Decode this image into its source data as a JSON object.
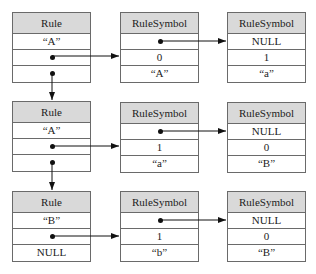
{
  "diagram": {
    "title": "",
    "rows": [
      {
        "rule": {
          "header": "Rule",
          "fields": [
            "“A”",
            "•",
            "•"
          ]
        },
        "symbol1": {
          "header": "RuleSymbol",
          "fields": [
            "•",
            "0",
            "“A”"
          ]
        },
        "symbol2": {
          "header": "RuleSymbol",
          "fields": [
            "NULL",
            "1",
            "“a”"
          ]
        }
      },
      {
        "rule": {
          "header": "Rule",
          "fields": [
            "“A”",
            "•",
            "•"
          ]
        },
        "symbol1": {
          "header": "RuleSymbol",
          "fields": [
            "•",
            "1",
            "“a”"
          ]
        },
        "symbol2": {
          "header": "RuleSymbol",
          "fields": [
            "NULL",
            "0",
            "“B”"
          ]
        }
      },
      {
        "rule": {
          "header": "Rule",
          "fields": [
            "“B”",
            "•",
            "NULL"
          ]
        },
        "symbol1": {
          "header": "RuleSymbol",
          "fields": [
            "•",
            "1",
            "“b”"
          ]
        },
        "symbol2": {
          "header": "RuleSymbol",
          "fields": [
            "NULL",
            "0",
            "“B”"
          ]
        }
      }
    ],
    "colors": {
      "header_fill": "#d9d9d9",
      "border": "#6a6a6a",
      "line": "#111111"
    }
  }
}
